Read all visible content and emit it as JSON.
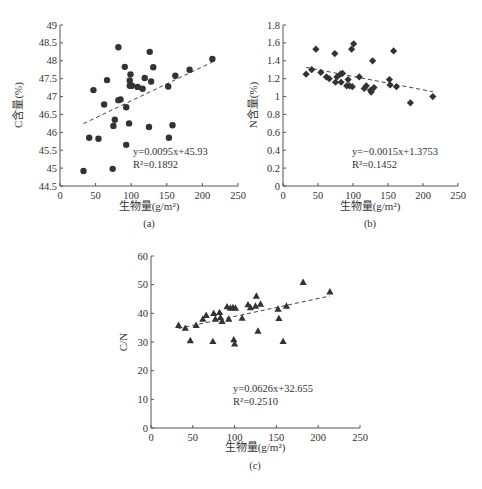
{
  "figure": {
    "panels": [
      "(a)",
      "(b)",
      "(c)"
    ]
  },
  "chart_data": [
    {
      "id": "a",
      "type": "scatter",
      "panel_label": "(a)",
      "title": "",
      "xlabel": "生物量(g/m²)",
      "ylabel": "C含量(%)",
      "xlim": [
        0,
        250
      ],
      "ylim": [
        44.5,
        49
      ],
      "xticks": [
        0,
        50,
        100,
        150,
        200,
        250
      ],
      "yticks": [
        44.5,
        45,
        45.5,
        46,
        46.5,
        47,
        47.5,
        48,
        48.5,
        49
      ],
      "ytick_labels": [
        "44.5",
        "45",
        "45.5",
        "46",
        "46.5",
        "47",
        "47.5",
        "48",
        "48.5",
        "49"
      ],
      "grid": false,
      "marker": "circle",
      "series": [
        {
          "name": "C content",
          "points": [
            [
              33,
              44.92
            ],
            [
              41,
              45.85
            ],
            [
              47,
              47.18
            ],
            [
              54,
              45.82
            ],
            [
              62,
              46.78
            ],
            [
              66,
              47.46
            ],
            [
              74,
              44.98
            ],
            [
              75,
              46.18
            ],
            [
              77,
              46.35
            ],
            [
              82,
              48.38
            ],
            [
              82,
              46.9
            ],
            [
              85,
              46.92
            ],
            [
              91,
              47.83
            ],
            [
              93,
              45.65
            ],
            [
              93,
              46.7
            ],
            [
              97,
              46.25
            ],
            [
              98,
              47.3
            ],
            [
              98,
              47.45
            ],
            [
              99,
              47.62
            ],
            [
              101,
              47.3
            ],
            [
              109,
              47.27
            ],
            [
              116,
              47.22
            ],
            [
              119,
              47.52
            ],
            [
              125,
              46.15
            ],
            [
              126,
              48.25
            ],
            [
              128,
              47.42
            ],
            [
              131,
              47.82
            ],
            [
              152,
              47.28
            ],
            [
              153,
              45.85
            ],
            [
              158,
              46.2
            ],
            [
              162,
              47.58
            ],
            [
              182,
              47.75
            ],
            [
              214,
              48.05
            ]
          ]
        }
      ],
      "trendline": {
        "style": "dashed",
        "slope": 0.0095,
        "intercept": 45.93,
        "x_range": [
          33,
          214
        ],
        "equation": "y=0.0095x+45.93",
        "r2": "R²=0.1892"
      },
      "annotations": [
        "y=0.0095x+45.93",
        "R²=0.1892"
      ]
    },
    {
      "id": "b",
      "type": "scatter",
      "panel_label": "(b)",
      "title": "",
      "xlabel": "生物量(g/m²)",
      "ylabel": "N含量(%)",
      "xlim": [
        0,
        250
      ],
      "ylim": [
        0,
        1.8
      ],
      "xticks": [
        0,
        50,
        100,
        150,
        200,
        250
      ],
      "yticks": [
        0,
        0.2,
        0.4,
        0.6,
        0.8,
        1,
        1.2,
        1.4,
        1.6,
        1.8
      ],
      "ytick_labels": [
        "0",
        "0.2",
        "0.4",
        "0.6",
        "0.8",
        "1",
        "1.2",
        "1.4",
        "1.6",
        "1.8"
      ],
      "grid": false,
      "marker": "diamond",
      "series": [
        {
          "name": "N content",
          "points": [
            [
              33,
              1.25
            ],
            [
              41,
              1.3
            ],
            [
              47,
              1.53
            ],
            [
              54,
              1.27
            ],
            [
              62,
              1.22
            ],
            [
              66,
              1.2
            ],
            [
              74,
              1.48
            ],
            [
              75,
              1.16
            ],
            [
              77,
              1.22
            ],
            [
              82,
              1.25
            ],
            [
              83,
              1.16
            ],
            [
              85,
              1.26
            ],
            [
              91,
              1.12
            ],
            [
              93,
              1.19
            ],
            [
              95,
              1.12
            ],
            [
              98,
              1.53
            ],
            [
              99,
              1.11
            ],
            [
              101,
              1.59
            ],
            [
              109,
              1.22
            ],
            [
              116,
              1.09
            ],
            [
              119,
              1.12
            ],
            [
              125,
              1.07
            ],
            [
              126,
              1.05
            ],
            [
              128,
              1.4
            ],
            [
              130,
              1.1
            ],
            [
              152,
              1.19
            ],
            [
              153,
              1.13
            ],
            [
              158,
              1.51
            ],
            [
              162,
              1.11
            ],
            [
              182,
              0.93
            ],
            [
              214,
              1.0
            ]
          ]
        }
      ],
      "trendline": {
        "style": "dashed",
        "slope": -0.0015,
        "intercept": 1.3753,
        "x_range": [
          33,
          214
        ],
        "equation": "y=−0.0015x+1.3753",
        "r2": "R²=0.1452"
      },
      "annotations": [
        "y=−0.0015x+1.3753",
        "R²=0.1452"
      ]
    },
    {
      "id": "c",
      "type": "scatter",
      "panel_label": "(c)",
      "title": "",
      "xlabel": "生物量(g/m²)",
      "ylabel": "C/N",
      "xlim": [
        0,
        250
      ],
      "ylim": [
        0,
        60
      ],
      "xticks": [
        0,
        50,
        100,
        150,
        200,
        250
      ],
      "yticks": [
        0,
        10,
        20,
        30,
        40,
        50,
        60
      ],
      "ytick_labels": [
        "0",
        "10",
        "20",
        "30",
        "40",
        "50",
        "60"
      ],
      "grid": false,
      "marker": "triangle",
      "series": [
        {
          "name": "C/N",
          "points": [
            [
              33,
              35.8
            ],
            [
              41,
              34.8
            ],
            [
              47,
              30.5
            ],
            [
              54,
              35.8
            ],
            [
              62,
              38.0
            ],
            [
              66,
              39.3
            ],
            [
              74,
              30.2
            ],
            [
              75,
              40.0
            ],
            [
              77,
              38.0
            ],
            [
              82,
              40.3
            ],
            [
              83,
              38.5
            ],
            [
              85,
              37.2
            ],
            [
              91,
              42.3
            ],
            [
              93,
              38.0
            ],
            [
              95,
              41.8
            ],
            [
              98,
              42.0
            ],
            [
              99,
              30.8
            ],
            [
              100,
              29.3
            ],
            [
              101,
              41.8
            ],
            [
              109,
              38.3
            ],
            [
              116,
              43.0
            ],
            [
              119,
              42.0
            ],
            [
              125,
              42.5
            ],
            [
              126,
              46.0
            ],
            [
              128,
              33.8
            ],
            [
              131,
              43.2
            ],
            [
              152,
              41.5
            ],
            [
              153,
              38.2
            ],
            [
              158,
              30.2
            ],
            [
              162,
              42.5
            ],
            [
              182,
              50.8
            ],
            [
              214,
              47.5
            ]
          ]
        }
      ],
      "trendline": {
        "style": "dashed",
        "slope": 0.0626,
        "intercept": 32.655,
        "x_range": [
          33,
          214
        ],
        "equation": "y=0.0626x+32.655",
        "r2": "R²=0.2510"
      },
      "annotations": [
        "y=0.0626x+32.655",
        "R²=0.2510"
      ]
    }
  ]
}
